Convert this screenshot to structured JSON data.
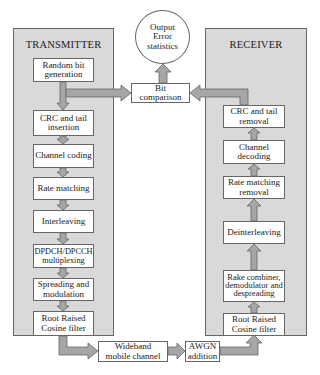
{
  "diagram": {
    "type": "block-diagram",
    "colors": {
      "panel_fill": "#d9d9d9",
      "arrow_fill": "#a6a6a6",
      "border": "#666666",
      "box_fill": "#ffffff"
    },
    "transmitter": {
      "title": "TRANSMITTER",
      "blocks": [
        {
          "id": "tx1",
          "label": "Random bit generation"
        },
        {
          "id": "tx2",
          "label": "CRC and tail insertion"
        },
        {
          "id": "tx3",
          "label": "Channel coding"
        },
        {
          "id": "tx4",
          "label": "Rate matching"
        },
        {
          "id": "tx5",
          "label": "Interleaving"
        },
        {
          "id": "tx6",
          "label": "DPDCH/DPCCH multiplexing"
        },
        {
          "id": "tx7",
          "label": "Spreading and modulation"
        },
        {
          "id": "tx8",
          "label": "Root Raised Cosine filter"
        }
      ]
    },
    "receiver": {
      "title": "RECEIVER",
      "blocks": [
        {
          "id": "rx1",
          "label": "CRC and tail removal"
        },
        {
          "id": "rx2",
          "label": "Channel decoding"
        },
        {
          "id": "rx3",
          "label": "Rate matching removal"
        },
        {
          "id": "rx4",
          "label": "Deinterleaving"
        },
        {
          "id": "rx5",
          "label": "Rake combiner, demodulator and despreading"
        },
        {
          "id": "rx6",
          "label": "Root Raised Cosine filter"
        }
      ]
    },
    "output": {
      "label": "Output Error statistics"
    },
    "bit_comparison": {
      "label": "Bit comparison"
    },
    "channel": {
      "label": "Wideband mobile channel"
    },
    "awgn": {
      "label": "AWGN addition"
    },
    "edges": [
      [
        "tx1",
        "tx2"
      ],
      [
        "tx2",
        "tx3"
      ],
      [
        "tx3",
        "tx4"
      ],
      [
        "tx4",
        "tx5"
      ],
      [
        "tx5",
        "tx6"
      ],
      [
        "tx6",
        "tx7"
      ],
      [
        "tx7",
        "tx8"
      ],
      [
        "tx8",
        "channel"
      ],
      [
        "channel",
        "awgn"
      ],
      [
        "awgn",
        "rx6"
      ],
      [
        "rx6",
        "rx5"
      ],
      [
        "rx5",
        "rx4"
      ],
      [
        "rx4",
        "rx3"
      ],
      [
        "rx3",
        "rx2"
      ],
      [
        "rx2",
        "rx1"
      ],
      [
        "tx1",
        "bit_comparison"
      ],
      [
        "rx1",
        "bit_comparison"
      ],
      [
        "bit_comparison",
        "output"
      ]
    ]
  }
}
